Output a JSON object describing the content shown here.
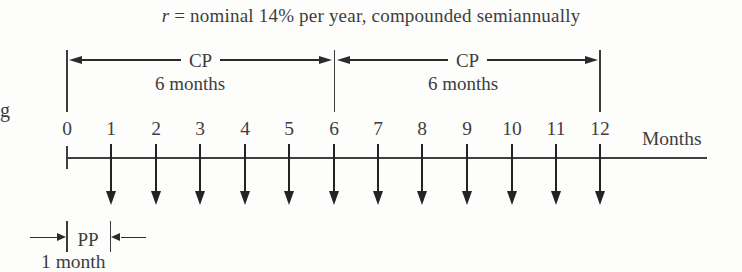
{
  "title": {
    "variable": "r",
    "text": "= nominal 14% per year, compounded semiannually"
  },
  "margin_fragment": "g",
  "compounding_periods": [
    {
      "label": "CP",
      "duration": "6 months",
      "start_month": 0,
      "end_month": 6
    },
    {
      "label": "CP",
      "duration": "6 months",
      "start_month": 6,
      "end_month": 12
    }
  ],
  "timeline": {
    "month_labels": [
      "0",
      "1",
      "2",
      "3",
      "4",
      "5",
      "6",
      "7",
      "8",
      "9",
      "10",
      "11",
      "12"
    ],
    "axis_label": "Months",
    "payment_arrow_months": [
      1,
      2,
      3,
      4,
      5,
      6,
      7,
      8,
      9,
      10,
      11,
      12
    ]
  },
  "payment_period": {
    "label": "PP",
    "duration": "1 month",
    "start_month": 0,
    "end_month": 1
  },
  "colors": {
    "ink": "#3e3e3e",
    "arrow": "#232323",
    "background": "#fdfdfc"
  }
}
